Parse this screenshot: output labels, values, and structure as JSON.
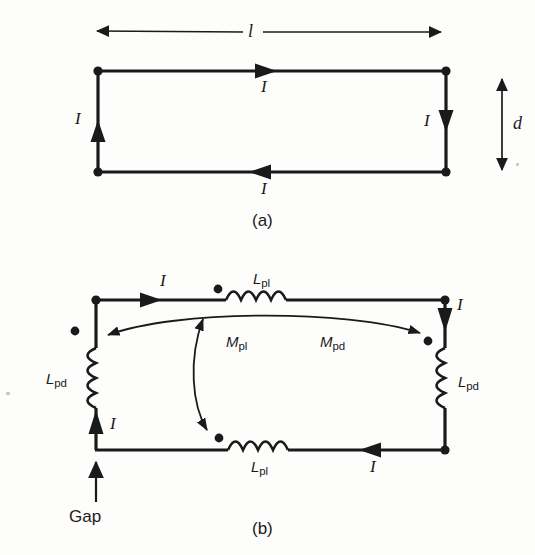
{
  "figure": {
    "ink_color": "#1a1a1a",
    "background_color": "#fdfdfc",
    "panels": [
      {
        "id": "a",
        "caption": "(a)",
        "description": "Rectangular conducting loop of length l and spacing d carrying current I",
        "dimension_labels": [
          {
            "name": "length",
            "text": "l"
          },
          {
            "name": "spacing",
            "text": "d"
          }
        ],
        "current_labels": [
          {
            "name": "current-top",
            "text": "I"
          },
          {
            "name": "current-left",
            "text": "I"
          },
          {
            "name": "current-right",
            "text": "I"
          },
          {
            "name": "current-bottom",
            "text": "I"
          }
        ]
      },
      {
        "id": "b",
        "caption": "(b)",
        "description": "Equivalent circuit with partial self inductances and partial mutual inductances",
        "inductors": [
          {
            "name": "inductor-top",
            "symbol": "L",
            "subscript": "pl"
          },
          {
            "name": "inductor-bottom",
            "symbol": "L",
            "subscript": "pl"
          },
          {
            "name": "inductor-left",
            "symbol": "L",
            "subscript": "pd"
          },
          {
            "name": "inductor-right",
            "symbol": "L",
            "subscript": "pd"
          }
        ],
        "mutuals": [
          {
            "name": "mutual-pl",
            "symbol": "M",
            "subscript": "pl"
          },
          {
            "name": "mutual-pd",
            "symbol": "M",
            "subscript": "pd"
          }
        ],
        "current_labels": [
          {
            "name": "current-top",
            "text": "I"
          },
          {
            "name": "current-right",
            "text": "I"
          },
          {
            "name": "current-bottom",
            "text": "I"
          },
          {
            "name": "current-left",
            "text": "I"
          }
        ],
        "gap_label": "Gap"
      }
    ]
  },
  "panel_a": {
    "caption": "(a)",
    "length_label": "l",
    "spacing_label": "d",
    "current_top": "I",
    "current_left": "I",
    "current_right": "I",
    "current_bottom": "I"
  },
  "panel_b": {
    "caption": "(b)",
    "ind_top_sym": "L",
    "ind_top_sub": "pl",
    "ind_bottom_sym": "L",
    "ind_bottom_sub": "pl",
    "ind_left_sym": "L",
    "ind_left_sub": "pd",
    "ind_right_sym": "L",
    "ind_right_sub": "pd",
    "mutual_pl_sym": "M",
    "mutual_pl_sub": "pl",
    "mutual_pd_sym": "M",
    "mutual_pd_sub": "pd",
    "current_top": "I",
    "current_right": "I",
    "current_bottom": "I",
    "current_left": "I",
    "gap_label": "Gap"
  }
}
